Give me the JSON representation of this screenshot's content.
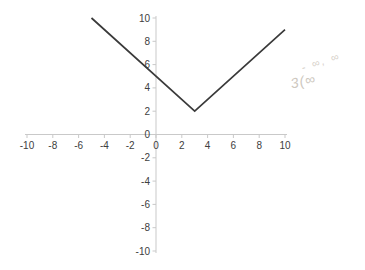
{
  "chart_data": {
    "type": "line",
    "title": "",
    "xlabel": "",
    "ylabel": "",
    "xlim": [
      -10,
      10
    ],
    "ylim": [
      -10,
      10
    ],
    "x_ticks": [
      -10,
      -8,
      -6,
      -4,
      -2,
      0,
      2,
      4,
      6,
      8,
      10
    ],
    "y_ticks": [
      10,
      8,
      6,
      4,
      2,
      0,
      -2,
      -4,
      -6,
      -8,
      -10
    ],
    "grid": false,
    "legend": false,
    "axis_color": "#c9c9c9",
    "tick_label_color": "#404040",
    "series": [
      {
        "name": "v-shaped-curve",
        "points": [
          [
            -5,
            10
          ],
          [
            3,
            2
          ],
          [
            10,
            9
          ]
        ],
        "color": "#3a3a3a",
        "stroke_width": 1.7
      }
    ]
  },
  "annotations": {
    "handwriting_line1": "- ∞, ∞",
    "handwriting_line2": "3(∞"
  }
}
